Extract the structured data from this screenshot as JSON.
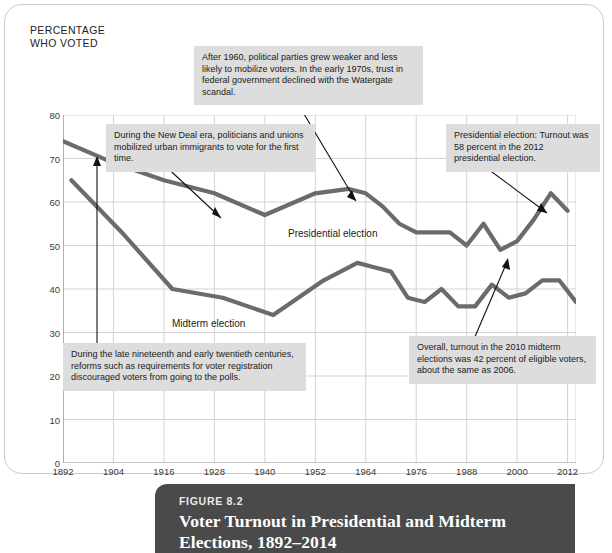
{
  "figure": {
    "kicker": "FIGURE 8.2",
    "title_line1": "Voter Turnout in Presidential and Midterm",
    "title_line2": "Elections, 1892–2014"
  },
  "axis_title_line1": "PERCENTAGE",
  "axis_title_line2": "WHO VOTED",
  "series_labels": {
    "presidential": "Presidential election",
    "midterm": "Midterm election"
  },
  "annotations": {
    "new_deal": "During the New Deal era, politicians and unions mobilized urban immigrants to vote for the first time.",
    "after_1960": "After 1960, political parties grew weaker and less likely to mobilize voters. In the early 1970s, trust in federal government declined with the Watergate scandal.",
    "turnout_2012": "Presidential election: Turnout was 58 percent in the 2012 presidential election.",
    "reforms": "During the late nineteenth and early twentieth centuries, reforms such as requirements for voter registration discouraged voters from going to the polls.",
    "midterm_2010": "Overall, turnout in the 2010 midterm elections was 42 percent of eligible voters, about the same as 2006."
  },
  "colors": {
    "line": "#6b6b6b",
    "grid": "#d3d3d3",
    "axis": "#8a8a8a",
    "callout_bg": "#dddddd",
    "caption_bg": "#4a4a4a"
  },
  "chart_data": {
    "type": "line",
    "title": "Voter Turnout in Presidential and Midterm Elections, 1892–2014",
    "xlabel": "",
    "ylabel": "PERCENTAGE WHO VOTED",
    "xlim": [
      1892,
      2014
    ],
    "ylim": [
      0,
      80
    ],
    "yticks": [
      0,
      10,
      20,
      30,
      40,
      50,
      60,
      70,
      80
    ],
    "xticks": [
      1892,
      1904,
      1916,
      1928,
      1940,
      1952,
      1964,
      1976,
      1988,
      2000,
      2012
    ],
    "grid": true,
    "legend": "inline-labels",
    "series": [
      {
        "name": "Presidential election",
        "x": [
          1892,
          1904,
          1916,
          1928,
          1940,
          1952,
          1960,
          1964,
          1968,
          1972,
          1976,
          1980,
          1984,
          1988,
          1992,
          1996,
          2000,
          2004,
          2008,
          2012
        ],
        "values": [
          74,
          69,
          65,
          62,
          57,
          62,
          63,
          62,
          59,
          55,
          53,
          53,
          53,
          50,
          55,
          49,
          51,
          56,
          62,
          58
        ]
      },
      {
        "name": "Midterm election",
        "x": [
          1894,
          1906,
          1918,
          1930,
          1942,
          1954,
          1962,
          1966,
          1970,
          1974,
          1978,
          1982,
          1986,
          1990,
          1994,
          1998,
          2002,
          2006,
          2010,
          2014
        ],
        "values": [
          65,
          53,
          40,
          38,
          34,
          42,
          46,
          45,
          44,
          38,
          37,
          40,
          36,
          36,
          41,
          38,
          39,
          42,
          42,
          37
        ]
      }
    ],
    "annotated_points": [
      {
        "label": "2012 presidential turnout",
        "x": 2012,
        "y": 58
      },
      {
        "label": "2010 midterm turnout",
        "x": 2010,
        "y": 42
      },
      {
        "label": "1892 presidential turnout",
        "x": 1892,
        "y": 71
      }
    ]
  }
}
